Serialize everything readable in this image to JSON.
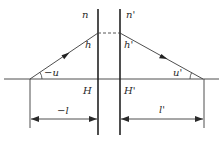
{
  "diagram": {
    "type": "optical-refraction-principal-planes",
    "labels": {
      "n": "n",
      "n_prime": "n'",
      "h": "h",
      "h_prime": "h'",
      "u": "−u",
      "u_prime": "u'",
      "H": "H",
      "H_prime": "H'",
      "l": "−l",
      "l_prime": "l'"
    },
    "colors": {
      "line": "#2a2a2a",
      "background": "#ffffff"
    }
  }
}
